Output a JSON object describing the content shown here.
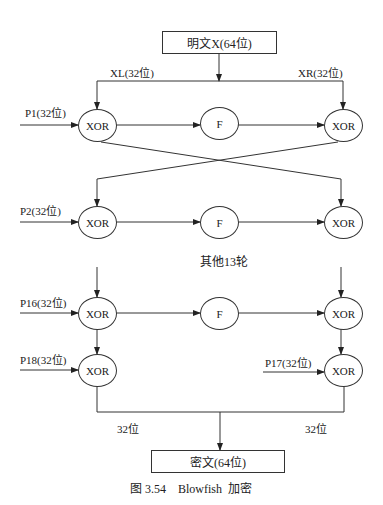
{
  "diagram": {
    "input_box": "明文X(64位)",
    "output_box": "密文(64位)",
    "split_labels": {
      "left": "XL(32位)",
      "right": "XR(32位)"
    },
    "merge_labels": {
      "left": "32位",
      "right": "32位"
    },
    "rounds_note": "其他13轮",
    "caption": "图 3.54    Blowfish  加密",
    "rows": [
      {
        "p_label": "P1(32位)",
        "left": "XOR",
        "mid": "F",
        "right": "XOR"
      },
      {
        "p_label": "P2(32位)",
        "left": "XOR",
        "mid": "F",
        "right": "XOR"
      },
      {
        "p_label": "P16(32位)",
        "left": "XOR",
        "mid": "F",
        "right": "XOR"
      }
    ],
    "final": {
      "left_p_label": "P18(32位)",
      "left": "XOR",
      "right_p_label": "P17(32位)",
      "right": "XOR"
    }
  }
}
